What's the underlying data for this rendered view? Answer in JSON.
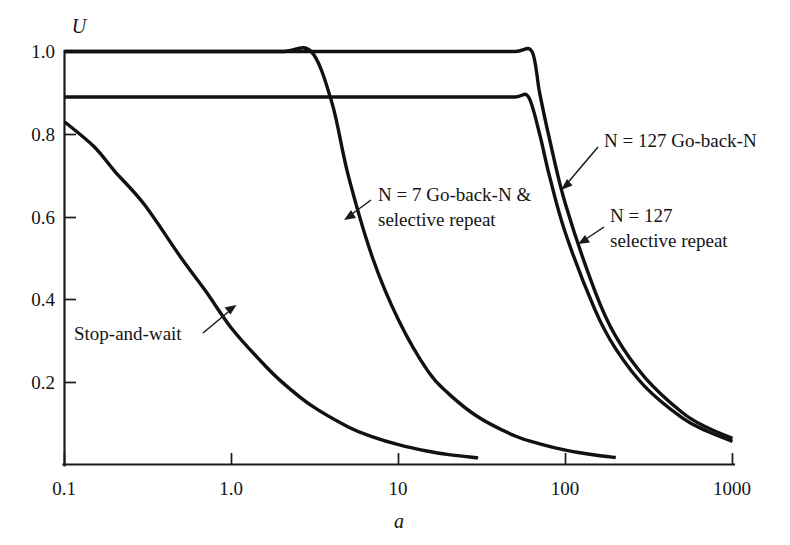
{
  "chart_data": {
    "type": "line",
    "title": "",
    "xlabel": "a",
    "ylabel": "U",
    "xscale": "log",
    "xlim": [
      0.1,
      1000
    ],
    "ylim": [
      0.0,
      1.0
    ],
    "grid": false,
    "legend_position": "inline-annotations",
    "xticks": [
      "0.1",
      "1.0",
      "10",
      "100",
      "1000"
    ],
    "xtick_values": [
      0.1,
      1.0,
      10,
      100,
      1000
    ],
    "yticks": [
      "1.0",
      "0.8",
      "0.6",
      "0.4",
      "0.2"
    ],
    "ytick_values": [
      1.0,
      0.8,
      0.6,
      0.4,
      0.2
    ],
    "series": [
      {
        "name": "Stop-and-wait",
        "x": [
          0.1,
          0.15,
          0.2,
          0.3,
          0.5,
          0.7,
          1.0,
          1.5,
          2.0,
          3.0,
          5.0,
          7.0,
          10.0,
          15.0,
          20.0,
          30.0
        ],
        "values": [
          0.83,
          0.77,
          0.71,
          0.63,
          0.5,
          0.42,
          0.33,
          0.25,
          0.2,
          0.143,
          0.091,
          0.067,
          0.048,
          0.032,
          0.024,
          0.016
        ]
      },
      {
        "name": "N = 7 Go-back-N & selective repeat",
        "x": [
          0.1,
          0.5,
          1.0,
          2.0,
          3.0,
          4.0,
          5.0,
          7.0,
          10.0,
          15.0,
          20.0,
          30.0,
          50.0,
          70.0,
          100.0,
          150.0,
          200.0
        ],
        "values": [
          1.0,
          1.0,
          1.0,
          1.0,
          1.0,
          0.875,
          0.7,
          0.5,
          0.35,
          0.226,
          0.171,
          0.115,
          0.069,
          0.05,
          0.035,
          0.023,
          0.017
        ]
      },
      {
        "name": "N = 127 Go-back-N",
        "x": [
          0.1,
          1.0,
          10.0,
          30.0,
          50.0,
          63.0,
          70.0,
          80.0,
          100.0,
          150.0,
          200.0,
          300.0,
          500.0,
          700.0,
          1000.0
        ],
        "values": [
          1.0,
          1.0,
          1.0,
          1.0,
          1.0,
          1.0,
          0.9,
          0.79,
          0.63,
          0.42,
          0.31,
          0.21,
          0.126,
          0.09,
          0.063
        ]
      },
      {
        "name": "N = 127 selective repeat",
        "x": [
          0.1,
          1.0,
          10.0,
          30.0,
          50.0,
          60.0,
          70.0,
          80.0,
          100.0,
          150.0,
          200.0,
          300.0,
          500.0,
          700.0,
          1000.0
        ],
        "values": [
          0.89,
          0.89,
          0.89,
          0.89,
          0.89,
          0.89,
          0.8,
          0.7,
          0.56,
          0.375,
          0.28,
          0.188,
          0.113,
          0.081,
          0.056
        ]
      }
    ],
    "annotations": [
      {
        "id": "stop-and-wait",
        "lines": [
          "Stop-and-wait"
        ],
        "text": "Stop-and-wait"
      },
      {
        "id": "n7-go-back-n",
        "lines": [
          "N = 7 Go-back-N &",
          "selective repeat"
        ],
        "text": "N = 7 Go-back-N & selective repeat"
      },
      {
        "id": "n127-go-back-n",
        "lines": [
          "N = 127 Go-back-N"
        ],
        "text": "N = 127 Go-back-N"
      },
      {
        "id": "n127-selective-repeat",
        "lines": [
          "N = 127",
          "selective repeat"
        ],
        "text": "N = 127 selective repeat"
      }
    ],
    "colors": {
      "curve": "#111111",
      "axis": "#1a1a1a",
      "text": "#141414",
      "background": "#ffffff"
    }
  }
}
